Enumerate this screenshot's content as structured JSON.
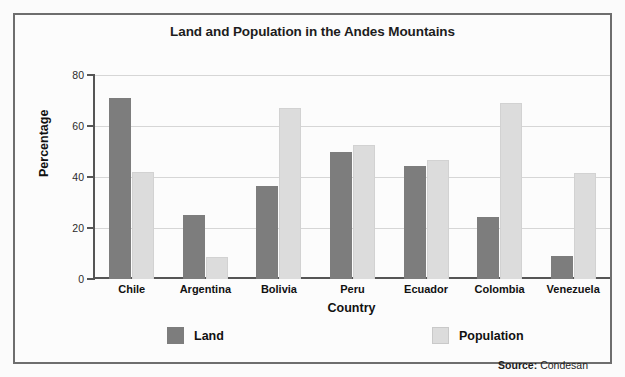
{
  "figure": {
    "source_label": "Source:",
    "source_value": "Condesan",
    "border_color": "#6e6e6e"
  },
  "legend": {
    "position": "bottom",
    "entries": [
      {
        "label": "Land",
        "color": "#7d7d7d",
        "swatch": "land"
      },
      {
        "label": "Population",
        "color": "#dcdcdc",
        "swatch": "population"
      }
    ]
  },
  "chart_data": {
    "type": "bar",
    "title": "Land and Population in the Andes Mountains",
    "xlabel": "Country",
    "ylabel": "Percentage",
    "ylim": [
      0,
      80
    ],
    "yticks": [
      0,
      20,
      40,
      60,
      80
    ],
    "grid": true,
    "legend_position": "bottom",
    "categories": [
      "Chile",
      "Argentina",
      "Bolivia",
      "Peru",
      "Ecuador",
      "Colombia",
      "Venezuela"
    ],
    "series": [
      {
        "name": "Land",
        "color": "#7d7d7d",
        "values": [
          71,
          25,
          36.5,
          50,
          44.5,
          24.5,
          9
        ]
      },
      {
        "name": "Population",
        "color": "#dcdcdc",
        "values": [
          42,
          8.5,
          67,
          52.5,
          46.5,
          69,
          41.5
        ]
      }
    ]
  }
}
